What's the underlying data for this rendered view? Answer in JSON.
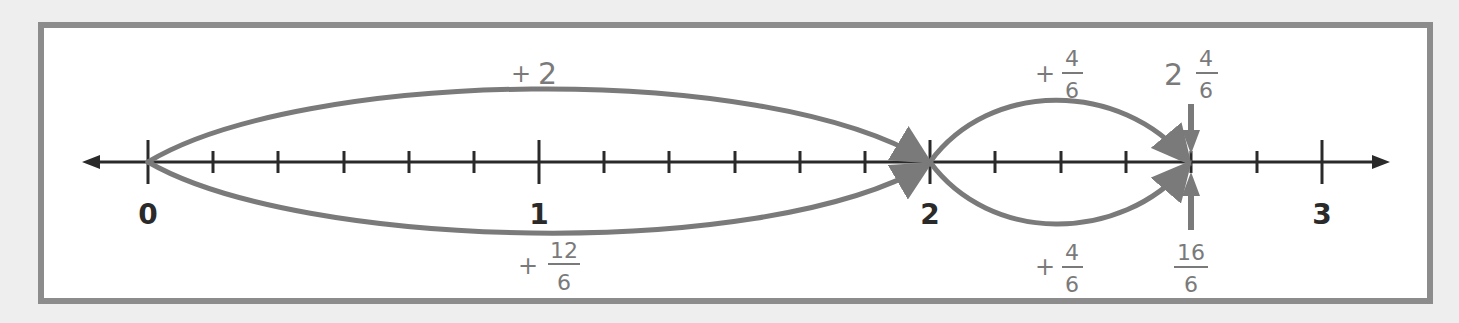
{
  "diagram": {
    "type": "number-line",
    "colors": {
      "axis": "#2a2a2a",
      "arc": "#7a7a7a",
      "label_gray": "#7a7a7a",
      "frame_border": "#8c8c8c",
      "background": "#eeeeee"
    },
    "axis": {
      "min": 0,
      "max": 3,
      "subdivisions_per_unit": 6,
      "major_labels": [
        "0",
        "1",
        "2",
        "3"
      ]
    },
    "top_jumps": [
      {
        "from": 0,
        "to": 2,
        "label_prefix": "+",
        "label_whole": "2"
      },
      {
        "from": 2,
        "to": 2.6667,
        "label_prefix": "+",
        "label_numerator": "4",
        "label_denominator": "6"
      }
    ],
    "bottom_jumps": [
      {
        "from": 0,
        "to": 2,
        "label_prefix": "+",
        "label_numerator": "12",
        "label_denominator": "6"
      },
      {
        "from": 2,
        "to": 2.6667,
        "label_prefix": "+",
        "label_numerator": "4",
        "label_denominator": "6"
      }
    ],
    "top_marker": {
      "position": 2.6667,
      "whole": "2",
      "numerator": "4",
      "denominator": "6"
    },
    "bottom_marker": {
      "position": 2.6667,
      "numerator": "16",
      "denominator": "6"
    }
  }
}
